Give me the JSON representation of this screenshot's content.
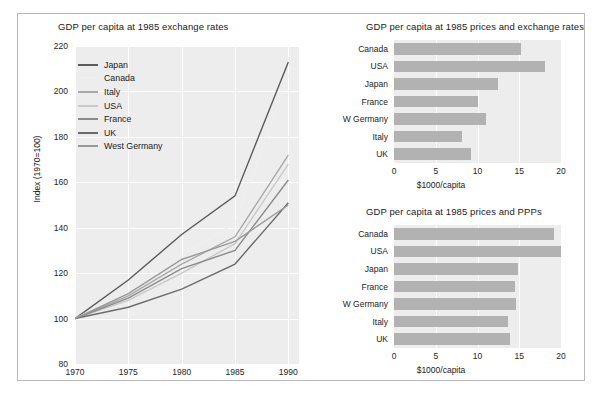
{
  "figure": {
    "background": "#ffffff",
    "frame_color": "#b9b9b9",
    "plot_background": "#ededed",
    "grid_color": "#ffffff",
    "bar_color": "#b2b2b2"
  },
  "chart_data": [
    {
      "id": "line-chart",
      "type": "line",
      "title": "GDP per capita at 1985 exchange rates",
      "xlabel": "",
      "ylabel": "Index (1970=100)",
      "x": [
        1970,
        1975,
        1980,
        1985,
        1990
      ],
      "xlim": [
        1970,
        1991
      ],
      "ylim": [
        80,
        220
      ],
      "xticks": [
        1970,
        1975,
        1980,
        1985,
        1990
      ],
      "yticks": [
        80,
        100,
        120,
        140,
        160,
        180,
        200,
        220
      ],
      "grid": true,
      "legend_position": "upper-left",
      "series": [
        {
          "name": "Japan",
          "color": "#5a5a5a",
          "values": [
            100,
            117,
            137,
            154,
            213
          ]
        },
        {
          "name": "Canada",
          "color": "#efefef",
          "values": [
            100,
            112,
            128,
            142,
            207
          ]
        },
        {
          "name": "Italy",
          "color": "#a8a8a8",
          "values": [
            100,
            110,
            124,
            136,
            172
          ]
        },
        {
          "name": "USA",
          "color": "#c9c9c9",
          "values": [
            100,
            108,
            120,
            133,
            168
          ]
        },
        {
          "name": "France",
          "color": "#8a8a8a",
          "values": [
            100,
            109,
            122,
            130,
            161
          ]
        },
        {
          "name": "UK",
          "color": "#6b6b6b",
          "values": [
            100,
            105,
            113,
            124,
            151
          ]
        },
        {
          "name": "West Germany",
          "color": "#9a9a9a",
          "values": [
            100,
            111,
            126,
            134,
            150
          ]
        }
      ]
    },
    {
      "id": "bar-chart-exchange",
      "type": "bar",
      "orientation": "horizontal",
      "title": "GDP per capita at 1985 prices and exchange rates",
      "xlabel": "$1000/capita",
      "ylabel": "",
      "xlim": [
        0,
        20
      ],
      "xticks": [
        0,
        5,
        10,
        15,
        20
      ],
      "categories": [
        "Canada",
        "USA",
        "Japan",
        "France",
        "W Germany",
        "Italy",
        "UK"
      ],
      "values": [
        15.2,
        18.1,
        12.4,
        10.0,
        11.0,
        8.1,
        9.2
      ]
    },
    {
      "id": "bar-chart-ppp",
      "type": "bar",
      "orientation": "horizontal",
      "title": "GDP per capita at 1985 prices and PPPs",
      "xlabel": "$1000/capita",
      "ylabel": "",
      "xlim": [
        0,
        20
      ],
      "xticks": [
        0,
        5,
        10,
        15,
        20
      ],
      "categories": [
        "Canada",
        "USA",
        "Japan",
        "France",
        "W Germany",
        "Italy",
        "UK"
      ],
      "values": [
        19.2,
        20.4,
        14.9,
        14.5,
        14.6,
        13.7,
        13.9
      ]
    }
  ]
}
